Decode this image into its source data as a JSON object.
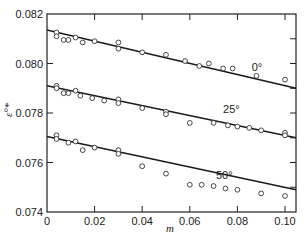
{
  "chart_data": {
    "type": "scatter",
    "title": "",
    "xlabel": "m",
    "ylabel": "ε°*",
    "xlim": [
      0,
      0.105
    ],
    "ylim": [
      0.074,
      0.082
    ],
    "x_ticks": [
      0,
      0.02,
      0.04,
      0.06,
      0.08,
      0.1
    ],
    "x_tick_labels": [
      "0",
      "0.02",
      "0.04",
      "0.06",
      "0.08",
      "0.10"
    ],
    "y_ticks": [
      0.074,
      0.076,
      0.078,
      0.08,
      0.082
    ],
    "y_tick_labels": [
      "0.074",
      "0.076",
      "0.078",
      "0.080",
      "0.082"
    ],
    "grid": false,
    "legend": "none (inline series labels)",
    "series": [
      {
        "name": "0°",
        "label_pos": [
          0.086,
          0.0797
        ],
        "fit_line": {
          "x": [
            0,
            0.105
          ],
          "y": [
            0.08135,
            0.079
          ]
        },
        "points": [
          [
            0.004,
            0.08125
          ],
          [
            0.004,
            0.0811
          ],
          [
            0.007,
            0.08095
          ],
          [
            0.009,
            0.08095
          ],
          [
            0.012,
            0.08105
          ],
          [
            0.015,
            0.08085
          ],
          [
            0.02,
            0.0809
          ],
          [
            0.03,
            0.08085
          ],
          [
            0.03,
            0.0806
          ],
          [
            0.04,
            0.08045
          ],
          [
            0.05,
            0.08035
          ],
          [
            0.058,
            0.0801
          ],
          [
            0.064,
            0.0799
          ],
          [
            0.068,
            0.08
          ],
          [
            0.074,
            0.0798
          ],
          [
            0.078,
            0.0798
          ],
          [
            0.088,
            0.0795
          ],
          [
            0.1,
            0.07935
          ]
        ]
      },
      {
        "name": "25°",
        "label_pos": [
          0.074,
          0.078
        ],
        "fit_line": {
          "x": [
            0,
            0.105
          ],
          "y": [
            0.0791,
            0.077
          ]
        },
        "points": [
          [
            0.004,
            0.0791
          ],
          [
            0.004,
            0.079
          ],
          [
            0.007,
            0.0788
          ],
          [
            0.009,
            0.0788
          ],
          [
            0.012,
            0.0789
          ],
          [
            0.014,
            0.0787
          ],
          [
            0.019,
            0.0786
          ],
          [
            0.024,
            0.0785
          ],
          [
            0.03,
            0.07855
          ],
          [
            0.03,
            0.0784
          ],
          [
            0.04,
            0.0782
          ],
          [
            0.05,
            0.07805
          ],
          [
            0.05,
            0.07795
          ],
          [
            0.06,
            0.0776
          ],
          [
            0.07,
            0.0776
          ],
          [
            0.076,
            0.0775
          ],
          [
            0.08,
            0.07745
          ],
          [
            0.085,
            0.0774
          ],
          [
            0.09,
            0.0773
          ],
          [
            0.1,
            0.0772
          ],
          [
            0.1,
            0.0771
          ]
        ]
      },
      {
        "name": "50°",
        "label_pos": [
          0.071,
          0.07535
        ],
        "fit_line": {
          "x": [
            0,
            0.105
          ],
          "y": [
            0.07705,
            0.0749
          ]
        },
        "points": [
          [
            0.004,
            0.0771
          ],
          [
            0.004,
            0.07695
          ],
          [
            0.009,
            0.0768
          ],
          [
            0.012,
            0.07685
          ],
          [
            0.015,
            0.0765
          ],
          [
            0.02,
            0.0766
          ],
          [
            0.03,
            0.0765
          ],
          [
            0.03,
            0.07635
          ],
          [
            0.04,
            0.07585
          ],
          [
            0.05,
            0.07555
          ],
          [
            0.06,
            0.0751
          ],
          [
            0.065,
            0.0751
          ],
          [
            0.07,
            0.07505
          ],
          [
            0.075,
            0.07495
          ],
          [
            0.08,
            0.0749
          ],
          [
            0.09,
            0.07475
          ],
          [
            0.1,
            0.07465
          ]
        ]
      }
    ],
    "colors": {
      "line": "#1a1a1a",
      "marker_stroke": "#333333",
      "marker_fill": "#ffffff",
      "axis": "#222222"
    }
  }
}
